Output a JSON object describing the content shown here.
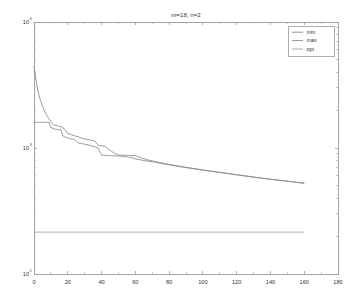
{
  "figure": {
    "title": "m=18, n=2",
    "background_color": "#ffffff",
    "axes_color": "#9a9a9a"
  },
  "legend": {
    "position": "top-right",
    "entries": [
      {
        "label": "min",
        "color": "#8a8a8a"
      },
      {
        "label": "max",
        "color": "#8a8a8a"
      },
      {
        "label": "opt",
        "color": "#9e9e9e"
      }
    ]
  },
  "axes": {
    "x": {
      "label": "",
      "scale": "linear",
      "min": 0,
      "max": 180,
      "ticks": [
        0,
        20,
        40,
        60,
        80,
        100,
        120,
        140,
        160,
        180
      ],
      "tick_labels": [
        "0",
        "20",
        "40",
        "60",
        "80",
        "100",
        "120",
        "140",
        "160",
        "180"
      ]
    },
    "y": {
      "label": "",
      "scale": "log",
      "min": 100,
      "max": 10000,
      "ticks": [
        100,
        1000,
        10000
      ],
      "tick_labels": [
        "10",
        "10",
        "10"
      ],
      "tick_exponents": [
        "2",
        "3",
        "4"
      ]
    }
  },
  "chart_data": {
    "type": "line",
    "title": "m=18, n=2",
    "xlabel": "",
    "ylabel": "",
    "xlim": [
      0,
      180
    ],
    "ylim": [
      100,
      10000
    ],
    "yscale": "log",
    "xscale": "linear",
    "grid": false,
    "legend": [
      "min",
      "max",
      "opt"
    ],
    "legend_position": "upper right",
    "series": [
      {
        "name": "min",
        "color": "#8a8a8a",
        "x": [
          0,
          2,
          4,
          6,
          8,
          9,
          10,
          12,
          14,
          16,
          17,
          18,
          20,
          22,
          24,
          26,
          28,
          30,
          32,
          34,
          36,
          38,
          40,
          42,
          44,
          46,
          48,
          50,
          52,
          54,
          56,
          58,
          60,
          64,
          68,
          72,
          76,
          80,
          84,
          88,
          92,
          96,
          100,
          104,
          108,
          112,
          116,
          120,
          124,
          128,
          132,
          136,
          140,
          144,
          148,
          152,
          156,
          160
        ],
        "y": [
          1600,
          1600,
          1600,
          1600,
          1600,
          1600,
          1450,
          1420,
          1400,
          1390,
          1250,
          1230,
          1200,
          1180,
          1170,
          1100,
          1085,
          1070,
          1060,
          1040,
          1020,
          1000,
          880,
          875,
          870,
          868,
          866,
          864,
          860,
          855,
          845,
          835,
          820,
          800,
          785,
          770,
          750,
          735,
          720,
          705,
          692,
          680,
          668,
          656,
          645,
          634,
          623,
          612,
          602,
          592,
          582,
          573,
          564,
          556,
          548,
          540,
          532,
          524
        ]
      },
      {
        "name": "max",
        "color": "#8a8a8a",
        "x": [
          0,
          1,
          2,
          3,
          4,
          5,
          6,
          7,
          8,
          9,
          10,
          11,
          12,
          14,
          16,
          18,
          20,
          22,
          24,
          26,
          28,
          30,
          32,
          34,
          36,
          38,
          40,
          42,
          44,
          46,
          48,
          50,
          52,
          54,
          56,
          58,
          60,
          64,
          68,
          72,
          76,
          80,
          84,
          88,
          92,
          96,
          100,
          104,
          108,
          112,
          116,
          120,
          124,
          128,
          132,
          136,
          140,
          144,
          148,
          152,
          156,
          160
        ],
        "y": [
          4500,
          3600,
          3000,
          2600,
          2350,
          2150,
          2000,
          1880,
          1780,
          1700,
          1620,
          1560,
          1520,
          1500,
          1470,
          1420,
          1300,
          1280,
          1250,
          1230,
          1200,
          1180,
          1165,
          1150,
          1140,
          1050,
          1040,
          1030,
          980,
          940,
          900,
          880,
          878,
          876,
          874,
          872,
          870,
          830,
          800,
          780,
          760,
          742,
          726,
          710,
          696,
          682,
          670,
          658,
          647,
          636,
          625,
          614,
          604,
          594,
          584,
          575,
          566,
          558,
          550,
          542,
          534,
          526
        ]
      },
      {
        "name": "opt",
        "color": "#9e9e9e",
        "x": [
          0,
          160
        ],
        "y": [
          215,
          215
        ]
      }
    ]
  }
}
